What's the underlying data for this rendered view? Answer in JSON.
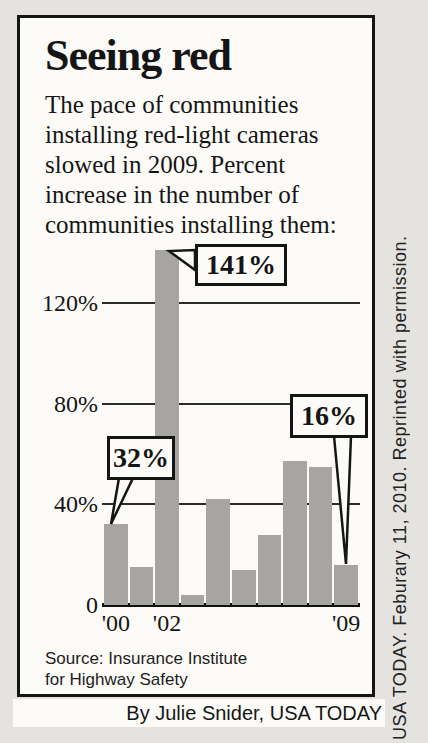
{
  "panel": {
    "title": "Seeing red",
    "description_lines": [
      "The pace of communities",
      "installing red-light cameras",
      "slowed in 2009. Percent",
      "increase in the number of",
      "communities installing them:"
    ],
    "source_lines": [
      "Source: Insurance Institute",
      "for Highway Safety"
    ]
  },
  "byline": "By Julie Snider, USA TODAY",
  "side_caption": "USA TODAY. Feburary 11, 2010. Reprinted with permission.",
  "colors": {
    "page_bg": "#e5e3df",
    "panel_bg": "#fcfbf7",
    "ink": "#151515",
    "bar": "#a6a5a2"
  },
  "chart_data": {
    "type": "bar",
    "title": "Seeing red",
    "subtitle": "The pace of communities installing red-light cameras slowed in 2009. Percent increase in the number of communities installing them:",
    "categories": [
      "'00",
      "'01",
      "'02",
      "'03",
      "'04",
      "'05",
      "'06",
      "'07",
      "'08",
      "'09"
    ],
    "values": [
      32,
      15,
      141,
      4,
      42,
      14,
      28,
      57,
      55,
      16
    ],
    "value_suffix": "%",
    "ylim": [
      0,
      150
    ],
    "yticks": [
      0,
      40,
      80,
      120
    ],
    "ytick_labels": [
      "0",
      "40%",
      "80%",
      "120%"
    ],
    "xticks_shown": [
      {
        "label": "'00",
        "index": 0
      },
      {
        "label": "'02",
        "index": 2
      },
      {
        "label": "'09",
        "index": 9
      }
    ],
    "annotations": [
      {
        "label": "141%",
        "category": "'02",
        "value": 141
      },
      {
        "label": "32%",
        "category": "'00",
        "value": 32
      },
      {
        "label": "16%",
        "category": "'09",
        "value": 16
      }
    ],
    "bar_color": "#a6a5a2",
    "grid": true,
    "legend": false,
    "source": "Insurance Institute for Highway Safety"
  }
}
